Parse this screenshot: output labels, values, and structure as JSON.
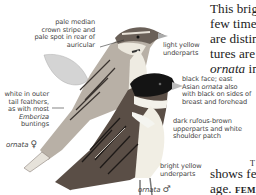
{
  "labels": {
    "crown": [
      "pale median",
      "crown stripe and",
      "pale spot in rear of",
      "auricular"
    ],
    "light_yellow": [
      "light yellow",
      "underparts"
    ],
    "white_tail": [
      "white in outer",
      "tail feathers,",
      "as with most"
    ],
    "white_tail_italic": "Emberiza",
    "white_tail_end": "buntings",
    "black_face_1": "black face; east",
    "black_face_2a": "Asian ",
    "black_face_2b": "ornata",
    "black_face_2c": " also",
    "black_face_3": "with black on sides of",
    "black_face_4": "breast and forehead",
    "rufous": [
      "dark rufous-brown",
      "upperparts and white",
      "shoulder patch"
    ],
    "bright_yellow": [
      "bright yellow",
      "underparts"
    ],
    "female_caption": "ornata",
    "female_symbol": "♀",
    "male_caption": "ornata",
    "male_symbol": "♂"
  },
  "body_text": {
    "line1": "This brig",
    "line2": "few times",
    "line3": "are distin",
    "line4": "tures are",
    "line5_italic": "ornata",
    "line5_rest": " in",
    "line6": "shows fea",
    "line7a": "age. ",
    "line7b": "FEMA",
    "top_fragment": "T",
    "bottom_fragment": "lt"
  },
  "colors": {
    "label_text": "#444444",
    "body_text": "#222222",
    "bird_dark": "#1a1a1a",
    "bird_mid": "#7a6f66",
    "bird_light": "#e8e4dc",
    "leaf": "#cfcfcf"
  }
}
